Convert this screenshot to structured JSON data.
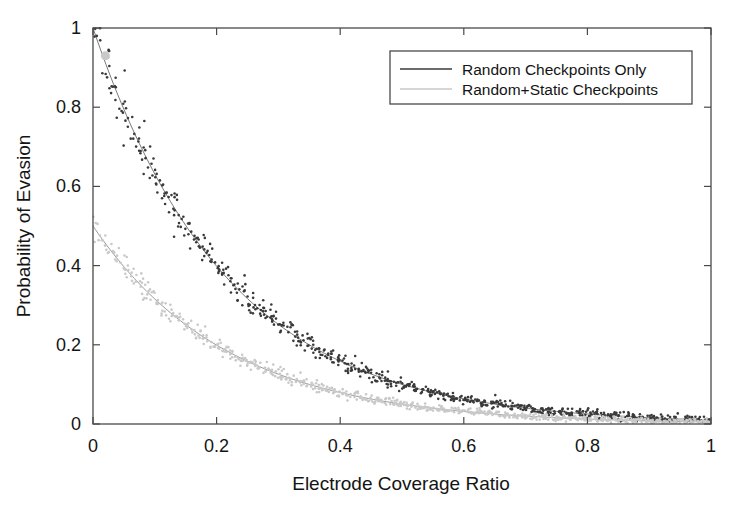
{
  "figure": {
    "background_color": "#ffffff",
    "frame_color": "#4a4a4a",
    "width": 744,
    "height": 515
  },
  "axes": {
    "x_label": "Electrode Coverage Ratio",
    "y_label": "Probability of Evasion",
    "x_ticks": [
      "0",
      "0.2",
      "0.4",
      "0.6",
      "0.8",
      "1"
    ],
    "y_ticks": [
      "0",
      "0.2",
      "0.4",
      "0.6",
      "0.8",
      "1"
    ]
  },
  "legend": {
    "entries": [
      {
        "label": "Random Checkpoints Only",
        "color": "#3a3a3a"
      },
      {
        "label": "Random+Static Checkpoints",
        "color": "#c9c9c9"
      }
    ]
  },
  "chart_data": {
    "type": "scatter",
    "title": "",
    "xlabel": "Electrode Coverage Ratio",
    "ylabel": "Probability of Evasion",
    "xlim": [
      0,
      1
    ],
    "ylim": [
      0,
      1
    ],
    "xticks": [
      0,
      0.2,
      0.4,
      0.6,
      0.8,
      1
    ],
    "yticks": [
      0,
      0.2,
      0.4,
      0.6,
      0.8,
      1
    ],
    "grid": false,
    "legend_position": "upper right",
    "series": [
      {
        "name": "Random Checkpoints Only",
        "color": "#3a3a3a",
        "marker": "dot",
        "marker_size": 2.6,
        "n_points": 700,
        "scatter_noise": 0.016,
        "fit": {
          "form": "exponential-decay",
          "expression": "y = exp(-4.6 * x)",
          "decay_rate": 4.6,
          "y_at_x0": 1.0,
          "line_color": "#6a6a6a"
        },
        "sample_points": [
          {
            "x": 0.0,
            "y": 1.0
          },
          {
            "x": 0.05,
            "y": 0.8
          },
          {
            "x": 0.1,
            "y": 0.63
          },
          {
            "x": 0.15,
            "y": 0.5
          },
          {
            "x": 0.2,
            "y": 0.4
          },
          {
            "x": 0.25,
            "y": 0.32
          },
          {
            "x": 0.3,
            "y": 0.25
          },
          {
            "x": 0.35,
            "y": 0.2
          },
          {
            "x": 0.4,
            "y": 0.16
          },
          {
            "x": 0.45,
            "y": 0.13
          },
          {
            "x": 0.5,
            "y": 0.1
          },
          {
            "x": 0.6,
            "y": 0.063
          },
          {
            "x": 0.7,
            "y": 0.04
          },
          {
            "x": 0.8,
            "y": 0.025
          },
          {
            "x": 0.9,
            "y": 0.016
          },
          {
            "x": 1.0,
            "y": 0.01
          }
        ]
      },
      {
        "name": "Random+Static Checkpoints",
        "color": "#c9c9c9",
        "marker": "dot",
        "marker_size": 2.6,
        "n_points": 700,
        "scatter_noise": 0.013,
        "fit": {
          "form": "exponential-decay",
          "expression": "y = 0.5 * exp(-4.6 * x)",
          "decay_rate": 4.6,
          "y_at_x0": 0.5,
          "line_color": "#8f8f8f"
        },
        "sample_points": [
          {
            "x": 0.0,
            "y": 0.5
          },
          {
            "x": 0.05,
            "y": 0.4
          },
          {
            "x": 0.1,
            "y": 0.315
          },
          {
            "x": 0.15,
            "y": 0.25
          },
          {
            "x": 0.2,
            "y": 0.2
          },
          {
            "x": 0.25,
            "y": 0.158
          },
          {
            "x": 0.3,
            "y": 0.126
          },
          {
            "x": 0.35,
            "y": 0.1
          },
          {
            "x": 0.4,
            "y": 0.079
          },
          {
            "x": 0.45,
            "y": 0.063
          },
          {
            "x": 0.5,
            "y": 0.05
          },
          {
            "x": 0.6,
            "y": 0.032
          },
          {
            "x": 0.7,
            "y": 0.02
          },
          {
            "x": 0.8,
            "y": 0.013
          },
          {
            "x": 0.9,
            "y": 0.008
          },
          {
            "x": 1.0,
            "y": 0.005
          }
        ]
      }
    ],
    "annotations": [
      {
        "type": "highlight-marker",
        "x": 0.02,
        "y": 0.93,
        "color": "#c9c9c9",
        "size": 9
      }
    ]
  }
}
